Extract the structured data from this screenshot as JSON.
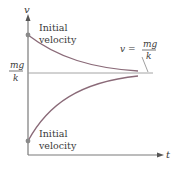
{
  "diagram": {
    "axes": {
      "y_label": "v",
      "x_label": "t"
    },
    "asymptote": {
      "left_label_num": "mg",
      "left_label_den": "k",
      "right_label_lhs": "v =",
      "right_label_num": "mg",
      "right_label_den": "k"
    },
    "upper_curve": {
      "label_line1": "Initial",
      "label_line2": "velocity"
    },
    "lower_curve": {
      "label_line1": "Initial",
      "label_line2": "velocity"
    },
    "colors": {
      "curve": "#8a6a78",
      "axis": "#7a7a7a",
      "asymptote": "#9a9a9a",
      "dot": "#8a8a8a",
      "text": "#3a3a3a"
    }
  }
}
